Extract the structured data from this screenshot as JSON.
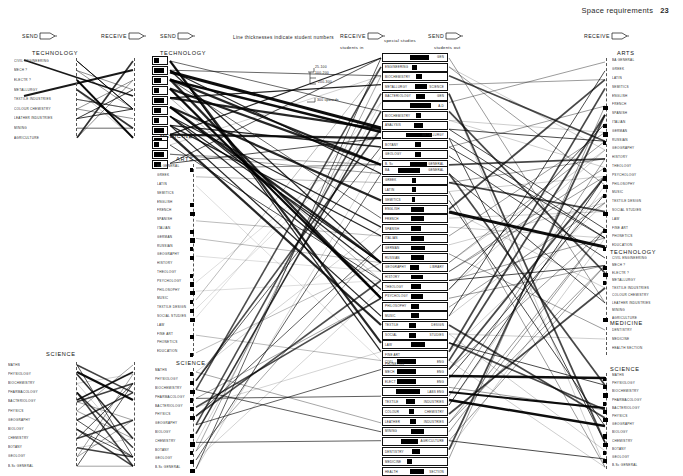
{
  "page": {
    "header_title": "Space requirements",
    "header_page": "23",
    "caption": "Line thicknesses  indicate  student numbers",
    "students_in": "students in",
    "students_out": "students out"
  },
  "flags": [
    {
      "id": "send-left",
      "label": "SEND",
      "icon": "send-arrow-icon"
    },
    {
      "id": "receive-left",
      "label": "RECEIVE",
      "icon": "receive-arrow-icon"
    },
    {
      "id": "send-mid",
      "label": "SEND",
      "icon": "send-arrow-icon"
    },
    {
      "id": "receive-mid",
      "label": "RECEIVE",
      "icon": "receive-arrow-icon"
    },
    {
      "id": "send-centre",
      "label": "SEND",
      "icon": "send-arrow-icon"
    },
    {
      "id": "receive-right",
      "label": "RECEIVE",
      "icon": "receive-arrow-icon"
    }
  ],
  "legend": {
    "title": "Line thicknesses  indicate  student numbers",
    "bands": [
      {
        "label": "25-100",
        "weight": 0.5
      },
      {
        "label": "100-200",
        "weight": 1.0
      },
      {
        "label": "200-300",
        "weight": 1.8
      },
      {
        "label": "300 upwards",
        "weight": 3.2
      }
    ]
  },
  "faculties": {
    "technology": {
      "title": "TECHNOLOGY",
      "subjects": [
        "CIVIL ENGINEERING",
        "MECH        ?",
        "ELECTR      ?",
        "METALLURGY",
        "TEXTILE INDUSTRIES",
        "COLOUR CHEMISTRY",
        "LEATHER INDUSTRIES",
        "MINING",
        "AGRICULTURE"
      ]
    },
    "medicine": {
      "title": "MEDICINE",
      "subjects": [
        "DENTISTRY",
        "MEDICINE",
        "HEALTH SECTION"
      ]
    },
    "arts": {
      "title": "ARTS",
      "subjects": [
        "BA GENERAL",
        "GREEK",
        "LATIN",
        "SEMITICS",
        "ENGLISH",
        "FRENCH",
        "SPANISH",
        "ITALIAN",
        "GERMAN",
        "RUSSIAN",
        "GEOGRAPHY",
        "HISTORY",
        "THEOLOGY",
        "PSYCHOLOGY",
        "PHILOSOPHY",
        "MUSIC",
        "TEXTILE DESIGN",
        "SOCIAL STUDIES",
        "LAW",
        "FINE ART",
        "PHONETICS",
        "EDUCATION"
      ]
    },
    "science": {
      "title": "SCIENCE",
      "subjects": [
        "MATHS",
        "PHYSIOLOGY",
        "BIOCHEMISTRY",
        "PHARMACOLOGY",
        "BACTERIOLOGY",
        "PHYSICS",
        "GEOGRAPHY",
        "BIOLOGY",
        "CHEMISTRY",
        "BOTANY",
        "GEOLOGY",
        "B.Sc GENERAL"
      ]
    }
  },
  "centre_column": {
    "heading": "special studies",
    "groups": [
      {
        "title": "",
        "rows": [
          {
            "left": "",
            "right": "GEN",
            "block": [
              42,
              30
            ]
          },
          {
            "left": "ENGINEERING",
            "right": "",
            "block": [
              46,
              7
            ]
          },
          {
            "left": "BIOCHEMISTRY",
            "right": "",
            "block": [
              52,
              9
            ]
          },
          {
            "left": "METALLURGY",
            "right": "SCIENCE",
            "block": [
              50,
              18
            ]
          },
          {
            "left": "BACTERIOLOGY",
            "right": "GEN",
            "block": [
              52,
              14
            ]
          },
          {
            "left": "",
            "right": "A-D",
            "block": [
              42,
              33
            ]
          },
          {
            "left": "BIOCHEMISTRY",
            "right": "",
            "block": [
              52,
              8
            ]
          },
          {
            "left": "ANALYSIS",
            "right": "",
            "block": [
              48,
              14
            ]
          },
          {
            "left": "",
            "right": "METALLURGY",
            "block": [
              36,
              40
            ]
          },
          {
            "left": "BOTANY",
            "right": "",
            "block": [
              50,
              9
            ]
          },
          {
            "left": "GEOLOGY",
            "right": "",
            "block": [
              50,
              10
            ]
          },
          {
            "left": "B. Sc",
            "right": "GENERAL",
            "block": [
              42,
              26
            ]
          }
        ]
      },
      {
        "title": "ARTS",
        "rows": [
          {
            "left": "BA",
            "right": "GENERAL",
            "block": [
              24,
              34
            ]
          },
          {
            "left": "GREEK",
            "right": "",
            "block": [
              46,
              5
            ]
          },
          {
            "left": "LATIN",
            "right": "",
            "block": [
              46,
              5
            ]
          },
          {
            "left": "SEMITICS",
            "right": "",
            "block": [
              46,
              4
            ]
          },
          {
            "left": "ENGLISH",
            "right": "",
            "block": [
              44,
              20
            ]
          },
          {
            "left": "FRENCH",
            "right": "",
            "block": [
              44,
              20
            ]
          },
          {
            "left": "SPANISH",
            "right": "",
            "block": [
              44,
              16
            ]
          },
          {
            "left": "ITALIAN",
            "right": "",
            "block": [
              44,
              20
            ]
          },
          {
            "left": "GERMAN",
            "right": "",
            "block": [
              44,
              22
            ]
          },
          {
            "left": "RUSSIAN",
            "right": "",
            "block": [
              44,
              20
            ]
          },
          {
            "left": "GEOGRAPHY",
            "right": "LIBRARY",
            "block": [
              42,
              14
            ]
          },
          {
            "left": "HISTORY",
            "right": "",
            "block": [
              44,
              18
            ]
          },
          {
            "left": "THEOLOGY",
            "right": "",
            "block": [
              44,
              16
            ]
          },
          {
            "left": "PSYCHOLOGY",
            "right": "",
            "block": [
              44,
              18
            ]
          },
          {
            "left": "PHILOSOPHY",
            "right": "",
            "block": [
              44,
              12
            ]
          },
          {
            "left": "MUSIC",
            "right": "",
            "block": [
              44,
              12
            ]
          },
          {
            "left": "TEXTILE",
            "right": "DESIGN",
            "block": [
              40,
              12
            ]
          },
          {
            "left": "SOCIAL",
            "right": "STUDIES",
            "block": [
              40,
              12
            ]
          },
          {
            "left": "LAW",
            "right": "",
            "block": [
              44,
              22
            ]
          },
          {
            "left": "FINE  ART",
            "right": "",
            "block": [
              0,
              0
            ]
          },
          {
            "left": "PHONETICS",
            "right": "",
            "block": [
              0,
              0
            ]
          }
        ]
      },
      {
        "title": "TECHNOLOGY",
        "rows": [
          {
            "left": "CIVIL",
            "right": "ENG",
            "block": [
              22,
              30
            ]
          },
          {
            "left": "MECH",
            "right": "ENG",
            "block": [
              22,
              30
            ]
          },
          {
            "left": "ELECT",
            "right": "ENG",
            "block": [
              22,
              30
            ]
          },
          {
            "left": "",
            "right": "LABS     ENG",
            "block": [
              20,
              38
            ]
          },
          {
            "left": "TEXTILE",
            "right": "INDUSTRIES",
            "block": [
              36,
              14
            ]
          },
          {
            "left": "COLOUR",
            "right": "CHEMISTRY",
            "block": [
              40,
              8
            ]
          },
          {
            "left": "LEATHER",
            "right": "INDUSTRIES",
            "block": [
              42,
              9
            ]
          },
          {
            "left": "MINING",
            "right": "",
            "block": [
              44,
              20
            ]
          },
          {
            "left": "",
            "right": "AGRICULTURE",
            "block": [
              28,
              26
            ]
          }
        ]
      },
      {
        "title": "MEDICINE",
        "rows": [
          {
            "left": "DENTISTRY",
            "right": "",
            "block": [
              46,
              12
            ]
          },
          {
            "left": "MEDICINE",
            "right": "",
            "block": [
              38,
              8
            ]
          },
          {
            "left": "HEALTH",
            "right": "SECTION",
            "block": [
              42,
              22
            ]
          }
        ]
      }
    ]
  },
  "colors": {
    "ink": "#000000",
    "paper": "#ffffff",
    "rule": "#555555",
    "label": "#2b2b2b"
  }
}
